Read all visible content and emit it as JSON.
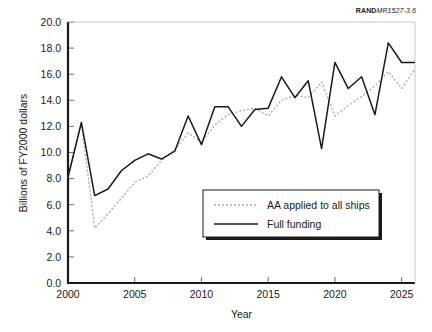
{
  "figure": {
    "source_credit_bold": "RAND",
    "source_credit_italic": "MR1527-3.6"
  },
  "chart_data": {
    "type": "line",
    "title": "",
    "xlabel": "Year",
    "ylabel": "Billions of FY2000 dollars",
    "xlim": [
      2000,
      2026
    ],
    "ylim": [
      0.0,
      20.0
    ],
    "xticks": [
      2000,
      2005,
      2010,
      2015,
      2020,
      2025
    ],
    "xticklabels": [
      "2000",
      "2005",
      "2010",
      "2015",
      "2020",
      "2025"
    ],
    "yticks": [
      0.0,
      2.0,
      4.0,
      6.0,
      8.0,
      10.0,
      12.0,
      14.0,
      16.0,
      18.0,
      20.0
    ],
    "yticklabels": [
      "0.0",
      "2.0",
      "4.0",
      "6.0",
      "8.0",
      "10.0",
      "12.0",
      "14.0",
      "16.0",
      "18.0",
      "20.0"
    ],
    "grid": false,
    "legend_position": "lower right",
    "x": [
      2000,
      2001,
      2002,
      2003,
      2004,
      2005,
      2006,
      2007,
      2008,
      2009,
      2010,
      2011,
      2012,
      2013,
      2014,
      2015,
      2016,
      2017,
      2018,
      2019,
      2020,
      2021,
      2022,
      2023,
      2024,
      2025,
      2026
    ],
    "series": [
      {
        "name": "AA applied to all ships",
        "style": "dotted",
        "color": "#a8a8a8",
        "values": [
          8.1,
          12.3,
          4.2,
          5.3,
          6.5,
          7.7,
          8.2,
          9.4,
          10.2,
          11.5,
          10.8,
          12.1,
          12.9,
          13.2,
          13.4,
          12.8,
          14.0,
          14.4,
          14.2,
          15.4,
          12.8,
          13.6,
          14.3,
          15.1,
          16.2,
          14.9,
          16.4
        ]
      },
      {
        "name": "Full funding",
        "style": "solid",
        "color": "#1a1a1a",
        "values": [
          8.1,
          12.3,
          6.7,
          7.2,
          8.6,
          9.4,
          9.9,
          9.5,
          10.1,
          12.8,
          10.6,
          13.5,
          13.5,
          12.0,
          13.3,
          13.4,
          15.8,
          14.2,
          15.5,
          10.3,
          16.9,
          14.9,
          15.8,
          12.9,
          18.4,
          16.9,
          16.9
        ]
      }
    ],
    "legend": [
      {
        "label": "AA applied to all ships",
        "style": "dotted",
        "color": "#a8a8a8"
      },
      {
        "label": "Full funding",
        "style": "solid",
        "color": "#1a1a1a"
      }
    ]
  }
}
